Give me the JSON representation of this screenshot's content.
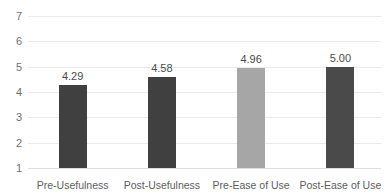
{
  "chart_data": {
    "type": "bar",
    "title": "",
    "xlabel": "",
    "ylabel": "",
    "categories": [
      "Pre-Usefulness",
      "Post-Usefulness",
      "Pre-Ease of Use",
      "Post-Ease of Use"
    ],
    "values": [
      4.29,
      4.58,
      4.96,
      5.0
    ],
    "value_labels": [
      "4.29",
      "4.58",
      "4.96",
      "5.00"
    ],
    "bar_colors": [
      "#404040",
      "#404040",
      "#a6a6a6",
      "#4a4a4a"
    ],
    "ylim": [
      1,
      7
    ],
    "y_ticks": [
      1,
      2,
      3,
      4,
      5,
      6,
      7
    ],
    "y_tick_labels": [
      "1",
      "2",
      "3",
      "4",
      "5",
      "6",
      "7"
    ],
    "grid": true,
    "legend": false
  },
  "axes": {
    "y_tick_labels": [
      "7",
      "6",
      "5",
      "4",
      "3",
      "2",
      "1"
    ]
  },
  "colors": {
    "bar_dark": "#404040",
    "bar_light": "#a6a6a6",
    "gridline": "#e9e9e9",
    "tick_text": "#6e6e6e",
    "label_text": "#5d5d5d",
    "value_text": "#4a4a4a",
    "background": "#ffffff"
  }
}
